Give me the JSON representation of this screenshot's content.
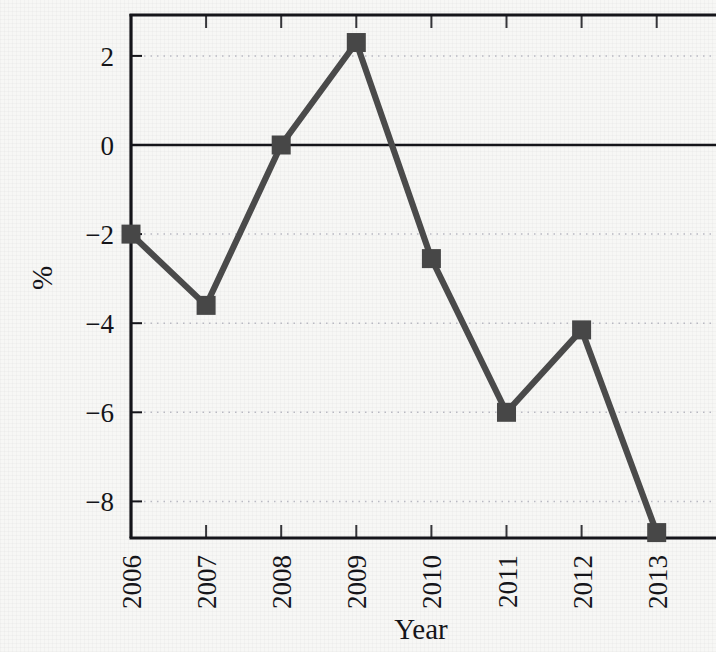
{
  "chart_data": {
    "type": "line",
    "title": "",
    "xlabel": "Year",
    "ylabel": "%",
    "categories": [
      "2006",
      "2007",
      "2008",
      "2009",
      "2010",
      "2011",
      "2012",
      "2013"
    ],
    "values": [
      -2.0,
      -3.6,
      0.0,
      2.3,
      -2.55,
      -6.0,
      -4.15,
      -8.7
    ],
    "series": [
      {
        "name": "%",
        "values": [
          -2.0,
          -3.6,
          0.0,
          2.3,
          -2.55,
          -6.0,
          -4.15,
          -8.7
        ]
      }
    ],
    "x_tick_labels": [
      "2006",
      "2007",
      "2008",
      "2009",
      "2010",
      "2011",
      "2012",
      "2013"
    ],
    "y_tick_labels": [
      "2",
      "0",
      "−2",
      "−4",
      "−6",
      "−8"
    ],
    "y_ticks": [
      2,
      0,
      -2,
      -4,
      -6,
      -8
    ],
    "ylim": [
      -9.1,
      2.85
    ],
    "xlim": [
      2005.72,
      2013.45
    ],
    "grid": "horizontal-dotted",
    "zero_line": true,
    "legend": "none",
    "marker": "square",
    "line_color": "#4a4a4a",
    "marker_color": "#474747",
    "axis_color": "#15151a",
    "grid_color": "#b9b9c2",
    "background_color": "#f7f7f5"
  },
  "figure": {
    "x_axis_title": "Year",
    "y_axis_title": "%"
  }
}
